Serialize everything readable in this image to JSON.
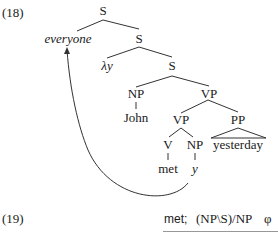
{
  "example18": {
    "number": "(18)",
    "nodes": {
      "s_root": "S",
      "everyone": "everyone",
      "s_2": "S",
      "lambda_y": "λy",
      "s_3": "S",
      "np_subj": "NP",
      "vp_top": "VP",
      "john": "John",
      "vp_inner": "VP",
      "pp": "PP",
      "yesterday": "yesterday",
      "v": "V",
      "np_obj": "NP",
      "met": "met",
      "y": "y"
    }
  },
  "example19": {
    "number": "(19)",
    "formula_word": "met;",
    "formula_type": "(NP\\S)/NP",
    "formula_sem": "φ"
  }
}
